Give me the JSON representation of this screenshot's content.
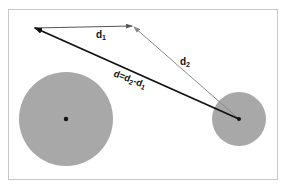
{
  "diagram": {
    "frame": {
      "x": 8,
      "y": 9,
      "w": 270,
      "h": 171,
      "stroke": "#c8c8c8"
    },
    "circles": [
      {
        "name": "large-body",
        "cx": 66,
        "cy": 119,
        "r": 47,
        "fill": "#a8a8a8"
      },
      {
        "name": "small-body",
        "cx": 239,
        "cy": 119,
        "r": 27,
        "fill": "#a8a8a8"
      }
    ],
    "points": {
      "left_tip": {
        "x": 34,
        "y": 28
      },
      "mid_tip": {
        "x": 133,
        "y": 26
      },
      "origin": {
        "x": 239,
        "y": 119
      }
    },
    "vectors": {
      "d1": {
        "label": "d",
        "sub": "1",
        "color": "#555555"
      },
      "d2": {
        "label": "d",
        "sub": "2",
        "color": "#888888"
      },
      "d": {
        "label_parts": [
          "d=d",
          "2",
          "-d",
          "1"
        ],
        "color": "#111111"
      }
    },
    "colors": {
      "accent_black": "#111111",
      "fill_gray": "#a8a8a8"
    }
  }
}
